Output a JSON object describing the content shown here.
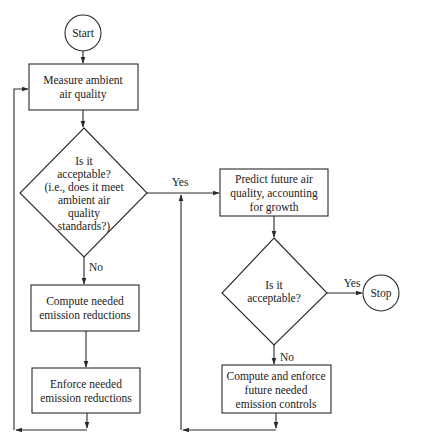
{
  "diagram": {
    "type": "flowchart",
    "nodes": {
      "start": {
        "label": "Start",
        "shape": "circle"
      },
      "measure": {
        "lines": [
          "Measure ambient",
          "air quality"
        ],
        "shape": "rect"
      },
      "decision1": {
        "lines": [
          "Is it",
          "acceptable?",
          "(i.e., does it meet",
          "ambient air",
          "quality",
          "standards?)"
        ],
        "shape": "diamond"
      },
      "compute": {
        "lines": [
          "Compute needed",
          "emission reductions"
        ],
        "shape": "rect"
      },
      "enforce": {
        "lines": [
          "Enforce needed",
          "emission reductions"
        ],
        "shape": "rect"
      },
      "predict": {
        "lines": [
          "Predict future air",
          "quality, accounting",
          "for growth"
        ],
        "shape": "rect"
      },
      "decision2": {
        "lines": [
          "Is it",
          "acceptable?"
        ],
        "shape": "diamond"
      },
      "stop": {
        "label": "Stop",
        "shape": "circle"
      },
      "compute_enforce": {
        "lines": [
          "Compute and enforce",
          "future needed",
          "emission controls"
        ],
        "shape": "rect"
      }
    },
    "edge_labels": {
      "d1_yes": "Yes",
      "d1_no": "No",
      "d2_yes": "Yes",
      "d2_no": "No"
    },
    "edges": [
      {
        "from": "start",
        "to": "measure"
      },
      {
        "from": "measure",
        "to": "decision1"
      },
      {
        "from": "decision1",
        "to": "predict",
        "label": "Yes"
      },
      {
        "from": "decision1",
        "to": "compute",
        "label": "No"
      },
      {
        "from": "compute",
        "to": "enforce"
      },
      {
        "from": "enforce",
        "to": "measure"
      },
      {
        "from": "predict",
        "to": "decision2"
      },
      {
        "from": "decision2",
        "to": "stop",
        "label": "Yes"
      },
      {
        "from": "decision2",
        "to": "compute_enforce",
        "label": "No"
      },
      {
        "from": "compute_enforce",
        "to": "predict"
      }
    ]
  }
}
